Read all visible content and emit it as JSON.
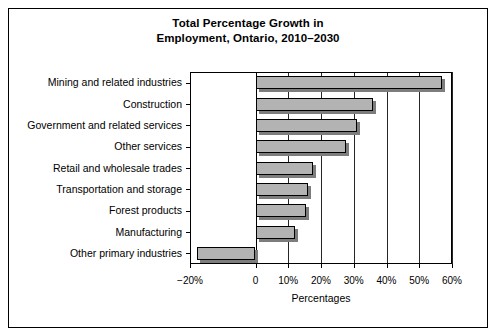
{
  "chart_data": {
    "type": "bar",
    "orientation": "horizontal",
    "title": "Total Percentage Growth in Employment, Ontario, 2010–2030",
    "title_lines": [
      "Total Percentage Growth in",
      "Employment, Ontario, 2010–2030"
    ],
    "xlabel": "Percentages",
    "ylabel": "",
    "categories": [
      "Mining and related industries",
      "Construction",
      "Government and related services",
      "Other services",
      "Retail and wholesale trades",
      "Transportation and storage",
      "Forest products",
      "Manufacturing",
      "Other primary industries"
    ],
    "values": [
      57,
      36,
      31,
      27.5,
      17.5,
      16,
      15.5,
      12,
      -18
    ],
    "xlim": [
      -20,
      60
    ],
    "xticks": [
      -20,
      0,
      10,
      20,
      30,
      40,
      50,
      60
    ],
    "xticklabels": [
      "−20%",
      "0",
      "10%",
      "20%",
      "30%",
      "40%",
      "50%",
      "60%"
    ],
    "grid": true,
    "legend": null,
    "bar_color": "#b3b3b3",
    "bar_edge_color": "#000000",
    "background_color": "#ffffff"
  }
}
